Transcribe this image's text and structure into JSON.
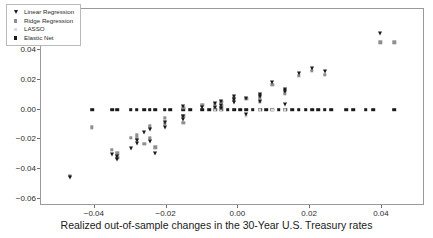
{
  "chart_data": {
    "type": "scatter",
    "title": "",
    "xlabel": "Realized out-of-sample changes in the 30-Year U.S. Treasury rates",
    "ylabel": "",
    "xlim": [
      -0.055,
      0.052
    ],
    "ylim": [
      -0.065,
      0.068
    ],
    "xticks": [
      -0.04,
      -0.02,
      0.0,
      0.02,
      0.04
    ],
    "xticklabels": [
      "−0.04",
      "−0.02",
      "0.00",
      "0.02",
      "0.04"
    ],
    "yticks": [
      -0.06,
      -0.04,
      -0.02,
      0.0,
      0.02,
      0.04,
      0.06
    ],
    "yticklabels": [
      "−0.06",
      "−0.04",
      "−0.02",
      "0.00",
      "0.02",
      "0.04",
      "0.06"
    ],
    "grid": false,
    "legend_position": "upper-left",
    "series": [
      {
        "name": "Linear Regression",
        "marker": "triangle-down",
        "color": "#1a1a1a",
        "points": [
          [
            -0.047,
            -0.0455
          ],
          [
            -0.0352,
            -0.03
          ],
          [
            -0.0337,
            -0.033
          ],
          [
            -0.0337,
            -0.031
          ],
          [
            -0.03,
            -0.0258
          ],
          [
            -0.0283,
            -0.0222
          ],
          [
            -0.0283,
            -0.0205
          ],
          [
            -0.0262,
            -0.015
          ],
          [
            -0.0247,
            -0.021
          ],
          [
            -0.0247,
            -0.0133
          ],
          [
            -0.0232,
            -0.029
          ],
          [
            -0.0205,
            -0.0118
          ],
          [
            -0.0205,
            -0.008
          ],
          [
            -0.0153,
            -0.004
          ],
          [
            -0.0153,
            0.0022
          ],
          [
            -0.0153,
            -0.0062
          ],
          [
            -0.01,
            0.002
          ],
          [
            -0.0065,
            0.0045
          ],
          [
            -0.0065,
            0.002
          ],
          [
            -0.0048,
            0.006
          ],
          [
            -0.0048,
            0.003
          ],
          [
            -0.0048,
            0.001
          ],
          [
            -0.0012,
            0.0075
          ],
          [
            -0.0012,
            0.009
          ],
          [
            -0.0012,
            0.005
          ],
          [
            0.0022,
            0.0082
          ],
          [
            0.0022,
            -0.003
          ],
          [
            0.006,
            0.0105
          ],
          [
            0.006,
            0.009
          ],
          [
            0.006,
            0.006
          ],
          [
            0.0095,
            0.0185
          ],
          [
            0.013,
            0.014
          ],
          [
            0.013,
            0.0125
          ],
          [
            0.013,
            0.0038
          ],
          [
            0.0168,
            0.0245
          ],
          [
            0.0205,
            0.0285
          ],
          [
            0.024,
            0.026
          ],
          [
            0.0395,
            0.052
          ]
        ]
      },
      {
        "name": "Ridge Regression",
        "marker": "square",
        "color": "#8e8e8e",
        "points": [
          [
            -0.047,
            -0.0445
          ],
          [
            -0.0408,
            -0.0118
          ],
          [
            -0.0352,
            -0.027
          ],
          [
            -0.0337,
            -0.0325
          ],
          [
            -0.0337,
            -0.0295
          ],
          [
            -0.03,
            -0.0188
          ],
          [
            -0.0283,
            -0.0196
          ],
          [
            -0.0283,
            -0.0172
          ],
          [
            -0.0262,
            -0.023
          ],
          [
            -0.0247,
            -0.0188
          ],
          [
            -0.0247,
            -0.0112
          ],
          [
            -0.0232,
            -0.0255
          ],
          [
            -0.0205,
            -0.0095
          ],
          [
            -0.0205,
            -0.0055
          ],
          [
            -0.0153,
            -0.004
          ],
          [
            -0.0153,
            0.0015
          ],
          [
            -0.0153,
            -0.0088
          ],
          [
            -0.01,
            0.0032
          ],
          [
            -0.0065,
            0.0038
          ],
          [
            -0.0065,
            0.0012
          ],
          [
            -0.0048,
            0.0052
          ],
          [
            -0.0048,
            0.0022
          ],
          [
            -0.0012,
            0.0068
          ],
          [
            -0.0012,
            0.008
          ],
          [
            0.0022,
            0.0075
          ],
          [
            0.006,
            0.0098
          ],
          [
            0.006,
            0.008
          ],
          [
            0.006,
            0.0052
          ],
          [
            0.0095,
            0.0168
          ],
          [
            0.013,
            0.013
          ],
          [
            0.013,
            0.0112
          ],
          [
            0.0168,
            0.0228
          ],
          [
            0.0205,
            0.0262
          ],
          [
            0.024,
            0.0235
          ],
          [
            0.0395,
            0.0455
          ],
          [
            0.0435,
            0.0455
          ]
        ]
      },
      {
        "name": "LASSO",
        "marker": "square",
        "color": "#d8d8d8",
        "points": [
          [
            -0.0337,
            -0.0318
          ],
          [
            -0.0283,
            -0.0182
          ],
          [
            -0.0247,
            -0.0198
          ],
          [
            -0.0205,
            -0.0072
          ],
          [
            -0.0153,
            -0.005
          ],
          [
            -0.0065,
            0.0
          ],
          [
            -0.0048,
            0.0
          ],
          [
            0.0022,
            -0.0042
          ],
          [
            0.006,
            0.0
          ],
          [
            0.0095,
            0.0
          ],
          [
            0.013,
            0.0
          ]
        ]
      },
      {
        "name": "Elastic Net",
        "marker": "square",
        "color": "#1a1a1a",
        "points": [
          [
            -0.0408,
            0.0
          ],
          [
            -0.0352,
            0.0
          ],
          [
            -0.0337,
            0.0
          ],
          [
            -0.03,
            0.0
          ],
          [
            -0.0283,
            0.0
          ],
          [
            -0.0262,
            0.0
          ],
          [
            -0.0247,
            0.0
          ],
          [
            -0.0232,
            0.0
          ],
          [
            -0.0205,
            0.0
          ],
          [
            -0.019,
            0.0
          ],
          [
            -0.0153,
            0.0
          ],
          [
            -0.0135,
            0.0
          ],
          [
            -0.01,
            0.0
          ],
          [
            -0.0082,
            0.0
          ],
          [
            -0.0065,
            0.0
          ],
          [
            -0.0048,
            0.0
          ],
          [
            -0.003,
            0.0
          ],
          [
            -0.0012,
            0.0
          ],
          [
            0.0005,
            0.0
          ],
          [
            0.0022,
            0.0
          ],
          [
            0.004,
            0.0
          ],
          [
            0.006,
            0.0
          ],
          [
            0.0078,
            0.0
          ],
          [
            0.0095,
            0.0
          ],
          [
            0.0112,
            0.0
          ],
          [
            0.013,
            0.0
          ],
          [
            0.015,
            0.0
          ],
          [
            0.0168,
            0.0
          ],
          [
            0.0188,
            0.0
          ],
          [
            0.0205,
            0.0
          ],
          [
            0.0222,
            0.0
          ],
          [
            0.024,
            0.0
          ],
          [
            0.0258,
            0.0
          ],
          [
            0.03,
            0.0
          ],
          [
            0.032,
            0.0
          ],
          [
            0.0355,
            0.0
          ],
          [
            0.0375,
            0.0
          ],
          [
            0.0435,
            0.0
          ]
        ]
      }
    ]
  }
}
